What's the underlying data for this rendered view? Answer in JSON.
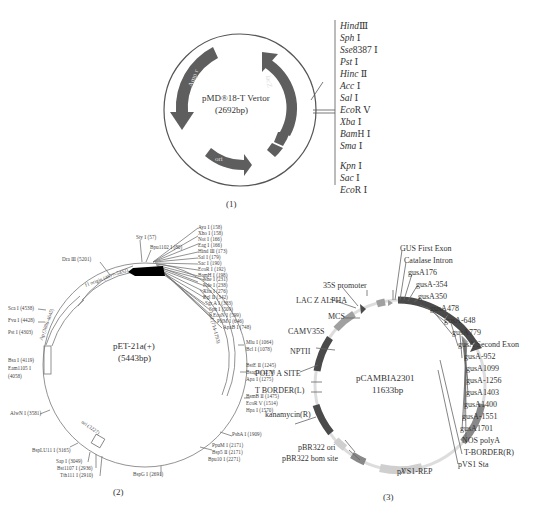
{
  "figure1": {
    "title": "pMD®18-T Vertor",
    "size": "(2692bp)",
    "caption": "(1)",
    "genes": [
      "Amp r",
      "lacZ",
      "ori"
    ],
    "sites": [
      {
        "italic": "Hind",
        "suffix": "Ⅲ"
      },
      {
        "italic": "Sph",
        "suffix": " Ⅰ"
      },
      {
        "italic": "Sse",
        "suffix": "8387 Ⅰ"
      },
      {
        "italic": "Pst",
        "suffix": " Ⅰ"
      },
      {
        "italic": "Hinc",
        "suffix": " Ⅱ"
      },
      {
        "italic": "Acc",
        "suffix": " Ⅰ"
      },
      {
        "italic": "Sal",
        "suffix": " Ⅰ"
      },
      {
        "italic": "Eco",
        "suffix": "R Ⅴ"
      },
      {
        "italic": "Xba",
        "suffix": " Ⅰ"
      },
      {
        "italic": "Bam",
        "suffix": "H Ⅰ"
      },
      {
        "italic": "Sma",
        "suffix": " Ⅰ"
      },
      {
        "italic": "Kpn",
        "suffix": " Ⅰ"
      },
      {
        "italic": "Sac",
        "suffix": " Ⅰ"
      },
      {
        "italic": "Eco",
        "suffix": "R Ⅰ"
      }
    ]
  },
  "figure2": {
    "title": "pET-21a(+)",
    "size": "(5443bp)",
    "caption": "(2)",
    "features": {
      "f1_origin": "f1 origin (4877-5432)",
      "ap": "Ap (3886-4645)",
      "laci": "lacI (714-1793)",
      "ori": "ori (3227)"
    },
    "sites_top_cluster": [
      "Aya Ⅰ (158)",
      "Xho Ⅰ (158)",
      "Not Ⅰ (166)",
      "Eag Ⅰ (166)",
      "Hind Ⅲ (173)",
      "Sal Ⅰ (179)",
      "Sac Ⅰ (190)",
      "EcoR Ⅰ (192)",
      "BamH Ⅰ (198)"
    ],
    "sites_mid_cluster": [
      "Nhe Ⅰ (231)",
      "Nde Ⅰ (238)",
      "Xba Ⅰ (276)",
      "Bgl Ⅱ (342)",
      "Sgr A Ⅰ (383)",
      "Sph Ⅰ (509)",
      "EcoN Ⅰ (599)",
      "PflM Ⅰ (646)",
      "ApaB Ⅰ (748)"
    ],
    "sites_left_top": [
      "Sty Ⅰ (57)",
      "Bpu1102 Ⅰ (80)"
    ],
    "sites_right": [
      "Mlu Ⅰ (1064)",
      "Bcl Ⅰ (1078)",
      "BstE Ⅱ (1245)",
      "Bsag Ⅰ (1273)",
      "Apa Ⅰ (1275)",
      "BsmB Ⅱ (1475)",
      "EcoR Ⅴ (1514)",
      "Hpa Ⅰ (1570)",
      "PshA Ⅰ (1909)"
    ],
    "sites_bottom_right": [
      "PpuM Ⅰ (2171)",
      "Bsp5 Ⅱ (2171)",
      "Bpu10 Ⅰ (2271)"
    ],
    "site_bottom": "BspG Ⅰ (2691)",
    "sites_bottom_left": [
      "BspLU11 Ⅰ (3165)",
      "Sap Ⅰ (3049)",
      "Bst1107 Ⅰ (2936)",
      "Tth111 Ⅰ (2910)"
    ],
    "site_alwn": "AlwN Ⅰ (3581)",
    "sites_left": [
      "Sca Ⅰ (4538)",
      "Fvu Ⅰ (4428)",
      "Pst Ⅰ (4303)"
    ],
    "sites_left_low": [
      "Bsa Ⅰ (4119)",
      "Eam1105 Ⅰ",
      "(4058)"
    ],
    "site_dra": "Dra Ⅲ (5201)"
  },
  "figure3": {
    "title": "pCAMBIA2301",
    "size": "11633bp",
    "caption": "(3)",
    "colors": {
      "dark": "#4a4a4a",
      "mid": "#8a8a8a",
      "light": "#c8c8c8"
    },
    "labels_left": [
      "35S promoter",
      "LAC Z ALPHA",
      "MCS",
      "CAMV35S",
      "NPTII",
      "POLY A SITE",
      "T BORDER(L)",
      "kanamycin(R)",
      "pBR322 ori",
      "pBR322 bom site"
    ],
    "labels_right": [
      "GUS First Exon",
      "Catalase Intron",
      "gusA176",
      "gusA-354",
      "gusA350",
      "gusA478",
      "gusA-648",
      "gusA779",
      "gusA Second Exon",
      "gusA-952",
      "gusA1099",
      "gusA-1256",
      "gusA1403",
      "gusA1400",
      "gusA-1551",
      "gusA1701",
      "NOS polyA",
      "T-BORDER(R)",
      "pVS1 Sta"
    ],
    "label_bottom": "pVS1-REP"
  }
}
